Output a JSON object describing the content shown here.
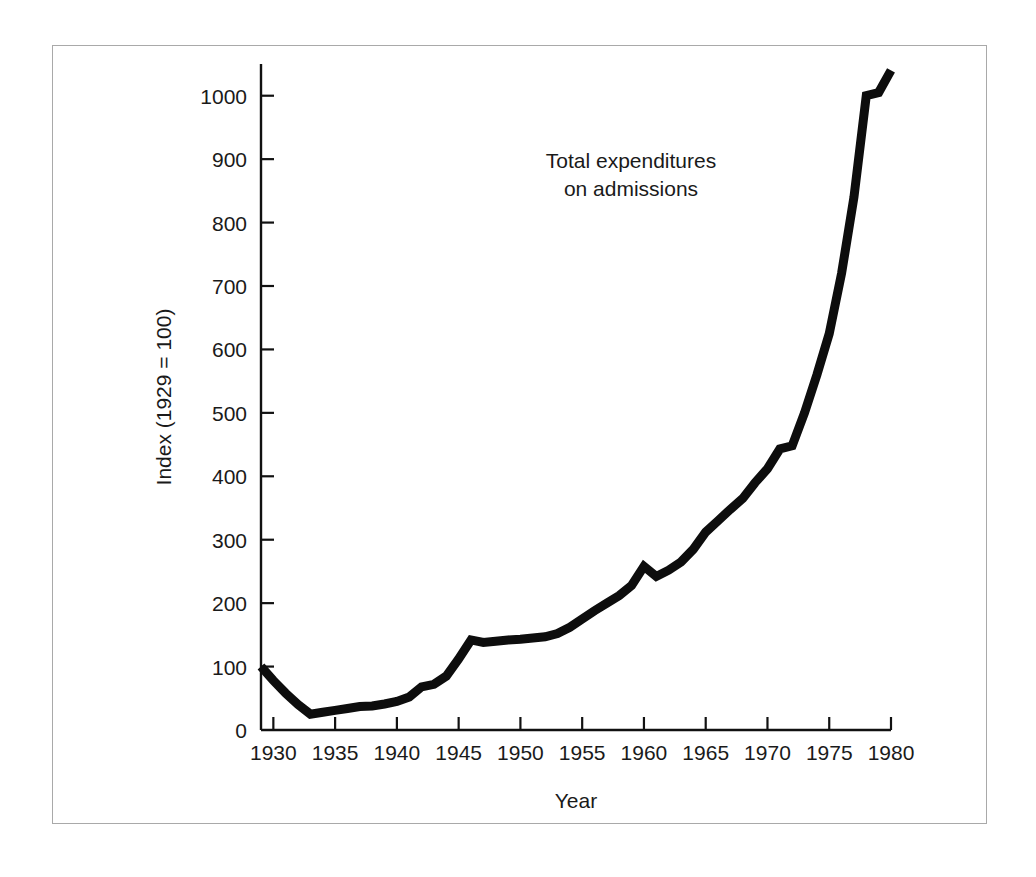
{
  "figure": {
    "background_color": "#ffffff",
    "frame_color": "#a9a9a9",
    "line_color": "#0d0d0d"
  },
  "chart_data": {
    "type": "line",
    "title": "",
    "xlabel": "Year",
    "ylabel": "Index (1929 = 100)",
    "annotation": {
      "line1": "Total expenditures",
      "line2": "on admissions"
    },
    "grid": false,
    "legend": "none",
    "xlim": [
      1929,
      1980
    ],
    "ylim": [
      0,
      1050
    ],
    "xticks": [
      1930,
      1935,
      1940,
      1945,
      1950,
      1955,
      1960,
      1965,
      1970,
      1975,
      1980
    ],
    "xtick_labels": [
      "1930",
      "1935",
      "1940",
      "1945",
      "1950",
      "1955",
      "1960",
      "1965",
      "1970",
      "1975",
      "1980"
    ],
    "yticks": [
      0,
      100,
      200,
      300,
      400,
      500,
      600,
      700,
      800,
      900,
      1000
    ],
    "ytick_labels": [
      "0",
      "100",
      "200",
      "300",
      "400",
      "500",
      "600",
      "700",
      "800",
      "900",
      "1000"
    ],
    "series": [
      {
        "name": "Total expenditures on admissions",
        "x": [
          1929,
          1930,
          1931,
          1932,
          1933,
          1934,
          1935,
          1936,
          1937,
          1938,
          1939,
          1940,
          1941,
          1942,
          1943,
          1944,
          1945,
          1946,
          1947,
          1948,
          1949,
          1950,
          1951,
          1952,
          1953,
          1954,
          1955,
          1956,
          1957,
          1958,
          1959,
          1960,
          1961,
          1962,
          1963,
          1964,
          1965,
          1966,
          1967,
          1968,
          1969,
          1970,
          1971,
          1972,
          1973,
          1974,
          1975,
          1976,
          1977,
          1978,
          1979,
          1980
        ],
        "y": [
          100,
          78,
          58,
          40,
          25,
          28,
          31,
          34,
          37,
          38,
          41,
          45,
          52,
          68,
          72,
          85,
          112,
          142,
          138,
          140,
          142,
          143,
          145,
          147,
          152,
          162,
          175,
          188,
          200,
          212,
          228,
          258,
          242,
          252,
          265,
          285,
          312,
          330,
          348,
          365,
          390,
          412,
          443,
          448,
          500,
          560,
          625,
          720,
          840,
          1000,
          1005,
          1040
        ]
      }
    ]
  }
}
